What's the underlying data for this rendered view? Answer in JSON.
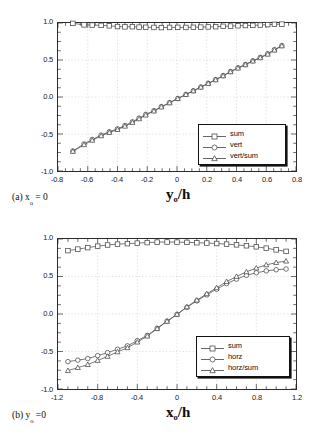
{
  "figure": {
    "panels": [
      {
        "id": "a",
        "caption_prefix": "(a) x",
        "caption_sub": "o",
        "caption_suffix": " = 0",
        "xlabel_main": "y",
        "xlabel_sub": "o",
        "xlabel_tail": "/h"
      },
      {
        "id": "b",
        "caption_prefix": "(b) y",
        "caption_sub": "o",
        "caption_suffix": " =0",
        "xlabel_main": "x",
        "xlabel_sub": "o",
        "xlabel_tail": "/h"
      }
    ]
  },
  "chart_data": [
    {
      "type": "line",
      "panel": "a",
      "title": "(a) xo = 0",
      "xlabel": "yo/h",
      "ylabel": "",
      "xlim": [
        -0.8,
        0.8
      ],
      "ylim": [
        -1.0,
        1.0
      ],
      "xticks": [
        "-0.8",
        "-0.6",
        "-0.4",
        "-0.2",
        "0",
        "0.2",
        "0.4",
        "0.6",
        "0.8"
      ],
      "xtick_values": [
        -0.8,
        -0.6,
        -0.4,
        -0.2,
        0,
        0.2,
        0.4,
        0.6,
        0.8
      ],
      "yticks": [
        "1.0",
        "0.5",
        "0.0",
        "-0.5",
        "-1.0"
      ],
      "ytick_values": [
        1.0,
        0.5,
        0.0,
        -0.5,
        -1.0
      ],
      "grid": true,
      "legend_position": "lower-right",
      "series": [
        {
          "name": "sum",
          "marker": "square",
          "x": [
            -0.7,
            -0.625,
            -0.57,
            -0.51,
            -0.455,
            -0.4,
            -0.35,
            -0.3,
            -0.255,
            -0.21,
            -0.155,
            -0.105,
            -0.05,
            0.005,
            0.06,
            0.11,
            0.16,
            0.21,
            0.26,
            0.31,
            0.36,
            0.41,
            0.46,
            0.51,
            0.56,
            0.61,
            0.655,
            0.705
          ],
          "y": [
            0.995,
            0.975,
            0.972,
            0.968,
            0.962,
            0.952,
            0.948,
            0.95,
            0.944,
            0.942,
            0.94,
            0.938,
            0.94,
            0.941,
            0.94,
            0.942,
            0.944,
            0.947,
            0.95,
            0.955,
            0.958,
            0.963,
            0.966,
            0.968,
            0.972,
            0.978,
            0.982,
            0.985
          ]
        },
        {
          "name": "vert",
          "marker": "circle",
          "x": [
            -0.7,
            -0.625,
            -0.57,
            -0.51,
            -0.455,
            -0.4,
            -0.35,
            -0.3,
            -0.255,
            -0.21,
            -0.155,
            -0.105,
            -0.05,
            0.005,
            0.06,
            0.11,
            0.16,
            0.21,
            0.26,
            0.31,
            0.36,
            0.41,
            0.46,
            0.51,
            0.56,
            0.61,
            0.655,
            0.705
          ],
          "y": [
            -0.73,
            -0.635,
            -0.575,
            -0.515,
            -0.47,
            -0.43,
            -0.385,
            -0.335,
            -0.285,
            -0.235,
            -0.185,
            -0.13,
            -0.075,
            -0.02,
            0.035,
            0.085,
            0.135,
            0.185,
            0.235,
            0.29,
            0.345,
            0.395,
            0.44,
            0.49,
            0.535,
            0.585,
            0.64,
            0.695
          ]
        },
        {
          "name": "vert/sum",
          "marker": "triangle",
          "x": [
            -0.7,
            -0.625,
            -0.57,
            -0.51,
            -0.455,
            -0.4,
            -0.35,
            -0.3,
            -0.255,
            -0.21,
            -0.155,
            -0.105,
            -0.05,
            0.005,
            0.06,
            0.11,
            0.16,
            0.21,
            0.26,
            0.31,
            0.36,
            0.41,
            0.46,
            0.51,
            0.56,
            0.61,
            0.655,
            0.705
          ],
          "y": [
            -0.735,
            -0.645,
            -0.585,
            -0.525,
            -0.48,
            -0.44,
            -0.395,
            -0.345,
            -0.295,
            -0.245,
            -0.19,
            -0.135,
            -0.08,
            -0.022,
            0.033,
            0.082,
            0.132,
            0.182,
            0.232,
            0.285,
            0.34,
            0.39,
            0.435,
            0.485,
            0.53,
            0.578,
            0.633,
            0.69
          ]
        }
      ],
      "legend": [
        "sum",
        "vert",
        "vert/sum"
      ]
    },
    {
      "type": "line",
      "panel": "b",
      "title": "(b) yo =0",
      "xlabel": "xo/h",
      "ylabel": "",
      "xlim": [
        -1.2,
        1.2
      ],
      "ylim": [
        -1.0,
        1.0
      ],
      "xticks": [
        "-1.2",
        "-0.8",
        "-0.4",
        "0",
        "0.4",
        "0.8",
        "1.2"
      ],
      "xtick_values": [
        -1.2,
        -0.8,
        -0.4,
        0,
        0.4,
        0.8,
        1.2
      ],
      "yticks": [
        "1.0",
        "0.5",
        "0.0",
        "-0.5",
        "-1.0"
      ],
      "ytick_values": [
        1.0,
        0.5,
        0.0,
        -0.5,
        -1.0
      ],
      "grid": true,
      "legend_position": "lower-right",
      "series": [
        {
          "name": "sum",
          "marker": "square",
          "x": [
            -1.1,
            -1.0,
            -0.9,
            -0.8,
            -0.7,
            -0.6,
            -0.5,
            -0.4,
            -0.3,
            -0.2,
            -0.1,
            0.0,
            0.1,
            0.2,
            0.3,
            0.4,
            0.5,
            0.6,
            0.7,
            0.8,
            0.9,
            1.0,
            1.1
          ],
          "y": [
            0.845,
            0.865,
            0.885,
            0.905,
            0.92,
            0.932,
            0.938,
            0.945,
            0.952,
            0.958,
            0.96,
            0.958,
            0.955,
            0.95,
            0.946,
            0.94,
            0.932,
            0.922,
            0.91,
            0.896,
            0.878,
            0.855,
            0.835
          ]
        },
        {
          "name": "horz",
          "marker": "circle",
          "x": [
            -1.1,
            -1.0,
            -0.9,
            -0.8,
            -0.7,
            -0.6,
            -0.5,
            -0.4,
            -0.3,
            -0.2,
            -0.1,
            0.0,
            0.1,
            0.2,
            0.3,
            0.4,
            0.5,
            0.6,
            0.7,
            0.8,
            0.9,
            1.0,
            1.1
          ],
          "y": [
            -0.635,
            -0.615,
            -0.595,
            -0.555,
            -0.515,
            -0.47,
            -0.425,
            -0.355,
            -0.285,
            -0.19,
            -0.095,
            -0.005,
            0.09,
            0.175,
            0.255,
            0.33,
            0.405,
            0.465,
            0.515,
            0.55,
            0.575,
            0.59,
            0.6
          ]
        },
        {
          "name": "horz/sum",
          "marker": "triangle",
          "x": [
            -1.1,
            -1.0,
            -0.9,
            -0.8,
            -0.7,
            -0.6,
            -0.5,
            -0.4,
            -0.3,
            -0.2,
            -0.1,
            0.0,
            0.1,
            0.2,
            0.3,
            0.4,
            0.5,
            0.6,
            0.7,
            0.8,
            0.9,
            1.0,
            1.1
          ],
          "y": [
            -0.755,
            -0.715,
            -0.675,
            -0.62,
            -0.565,
            -0.505,
            -0.45,
            -0.375,
            -0.295,
            -0.195,
            -0.098,
            -0.005,
            0.095,
            0.185,
            0.27,
            0.35,
            0.432,
            0.5,
            0.562,
            0.612,
            0.655,
            0.685,
            0.705
          ]
        }
      ],
      "legend": [
        "sum",
        "horz",
        "horz/sum"
      ]
    }
  ],
  "style": {
    "line_color": "#555555",
    "marker_edge": "#444444",
    "grid_color": "#c8c8c8",
    "axis_color": "#2b2b2b"
  }
}
